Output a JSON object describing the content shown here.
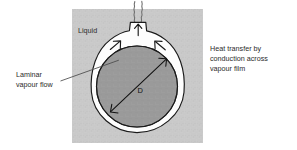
{
  "figure": {
    "title_visible": false,
    "background_color": "#ffffff",
    "panel": {
      "fill_color": "#c9c9c9",
      "x": 72,
      "y": 9,
      "width": 131,
      "height": 134
    },
    "labels": {
      "liquid": "Liquid",
      "laminar_line1": "Laminar",
      "laminar_line2": "vapour flow",
      "heat_line1": "Heat transfer by",
      "heat_line2": "conduction  across",
      "heat_line3": "vapour film",
      "diameter": "D"
    },
    "colors": {
      "panel_liquid": "#c9c9c9",
      "sphere": "#9a9a9a",
      "vapour_film": "#fdfdfd",
      "outline": "#1a1a1a",
      "text": "#2b2b2b",
      "leader_line": "#4a4a4a"
    },
    "geometry": {
      "sphere_center_x": 137,
      "sphere_center_y": 85,
      "sphere_radius": 40,
      "film_outer_radius": 47,
      "neck_top_y": 22
    },
    "icons": {
      "vapour_arrow_left": "arrow-up-right-icon",
      "vapour_arrow_center": "arrow-up-icon",
      "vapour_arrow_right": "arrow-up-left-icon",
      "plume": "wavy-vapour-plume-icon",
      "diameter_arrow": "double-headed-arrow-icon"
    }
  }
}
